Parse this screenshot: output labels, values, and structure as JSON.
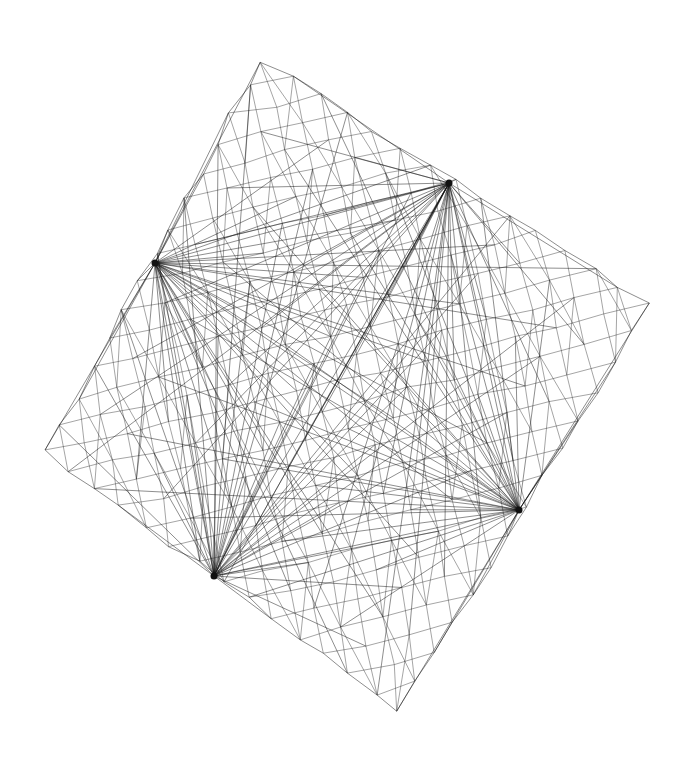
{
  "diagram": {
    "type": "network-graph",
    "background": "#ffffff",
    "edge_color": "#222222",
    "outer_corners": {
      "top": [
        263,
        60
      ],
      "right": [
        648,
        303
      ],
      "bottom": [
        400,
        712
      ],
      "left": [
        45,
        452
      ]
    },
    "grid_divisions": 14,
    "hubs": [
      {
        "id": "hub-upper-left",
        "x": 155,
        "y": 263
      },
      {
        "id": "hub-upper-right",
        "x": 449,
        "y": 183
      },
      {
        "id": "hub-lower-right",
        "x": 519,
        "y": 510
      },
      {
        "id": "hub-lower-left",
        "x": 214,
        "y": 576
      }
    ],
    "jitter": 7
  }
}
